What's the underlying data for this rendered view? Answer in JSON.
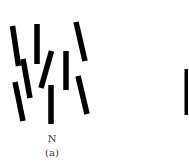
{
  "figure": {
    "panel_label": "(a)",
    "condition_label": "N",
    "bar_color": "#000000",
    "background": "#ffffff",
    "bar_width": 5.5,
    "bars": [
      {
        "x1": 12.5,
        "y1": 26,
        "x2": 18.5,
        "y2": 66
      },
      {
        "x1": 37,
        "y1": 24,
        "x2": 37,
        "y2": 64
      },
      {
        "x1": 23,
        "y1": 59,
        "x2": 30,
        "y2": 98
      },
      {
        "x1": 15,
        "y1": 82,
        "x2": 23,
        "y2": 121
      },
      {
        "x1": 51.5,
        "y1": 51,
        "x2": 41,
        "y2": 88
      },
      {
        "x1": 51,
        "y1": 85,
        "x2": 51,
        "y2": 124
      },
      {
        "x1": 66,
        "y1": 51,
        "x2": 66,
        "y2": 90
      },
      {
        "x1": 76,
        "y1": 22,
        "x2": 85,
        "y2": 61
      },
      {
        "x1": 78,
        "y1": 76,
        "x2": 87,
        "y2": 114
      }
    ],
    "partial_bar": {
      "x": 184.5,
      "y": 69,
      "width": 5,
      "height": 46
    }
  }
}
